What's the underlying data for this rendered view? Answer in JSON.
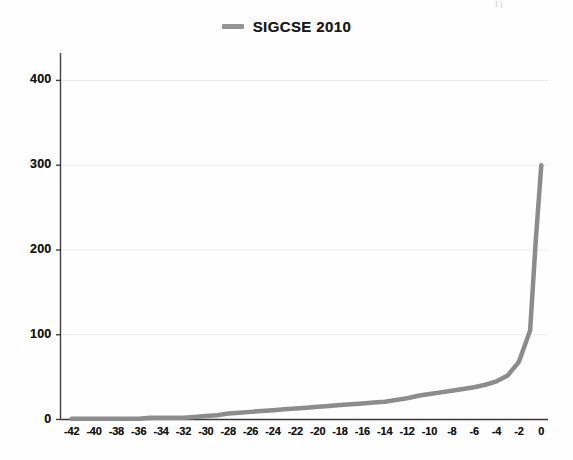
{
  "figure": {
    "width": 573,
    "height": 460,
    "background": "#fefefe",
    "scan_artifact_text": "1)"
  },
  "legend": {
    "position": "top-center",
    "entries": [
      {
        "label": "SIGCSE 2010",
        "color": "#949494",
        "marker": "line-swatch"
      }
    ]
  },
  "colors": {
    "series_line": "#8c8c8c",
    "gridline": "#ebebeb",
    "axis": "#2b2b2b",
    "tick_text": "#141414"
  },
  "chart_data": {
    "type": "line",
    "title": "",
    "subtitle": "",
    "xlabel": "",
    "ylabel": "",
    "xlim": [
      -43,
      0.6
    ],
    "ylim": [
      0,
      430
    ],
    "grid": true,
    "grid_axis": "y",
    "legend_position": "top-center",
    "y_ticks": [
      0,
      100,
      200,
      300,
      400
    ],
    "y_tick_labels": [
      "0",
      "100",
      "200",
      "300",
      "400"
    ],
    "x_ticks": [
      -42,
      -40,
      -38,
      -36,
      -34,
      -32,
      -30,
      -28,
      -26,
      -24,
      -22,
      -20,
      -18,
      -16,
      -14,
      -12,
      -10,
      -8,
      -6,
      -4,
      -2,
      0
    ],
    "x_tick_labels": [
      "-42",
      "-40",
      "-38",
      "-36",
      "-34",
      "-32",
      "-30",
      "-28",
      "-26",
      "-24",
      "-22",
      "-20",
      "-18",
      "-16",
      "-14",
      "-12",
      "-10",
      "-8",
      "-6",
      "-4",
      "-2",
      "0"
    ],
    "series": [
      {
        "name": "SIGCSE 2010",
        "color": "#8c8c8c",
        "line_width": 4.5,
        "x": [
          -42,
          -41,
          -40,
          -39,
          -38,
          -37,
          -36,
          -35,
          -34,
          -33,
          -32,
          -31,
          -30,
          -29,
          -28,
          -27,
          -26,
          -25,
          -24,
          -23,
          -22,
          -21,
          -20,
          -19,
          -18,
          -17,
          -16,
          -15,
          -14,
          -13,
          -12,
          -11,
          -10,
          -9,
          -8,
          -7,
          -6,
          -5,
          -4,
          -3,
          -2,
          -1,
          -0.5,
          0
        ],
        "values": [
          1,
          1,
          1,
          1,
          1,
          1,
          1,
          2,
          2,
          2,
          2,
          3,
          4,
          5,
          7,
          8,
          9,
          10,
          11,
          12,
          13,
          14,
          15,
          16,
          17,
          18,
          19,
          20,
          21,
          23,
          25,
          28,
          30,
          32,
          34,
          36,
          38,
          41,
          45,
          52,
          68,
          105,
          210,
          300
        ]
      }
    ]
  }
}
